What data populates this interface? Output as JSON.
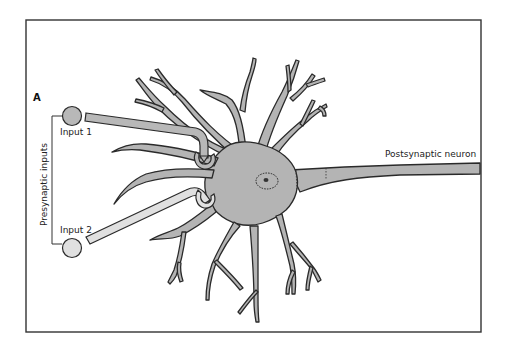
{
  "figure": {
    "panel_letter": "A",
    "labels": {
      "input_1": "Input 1",
      "input_2": "Input 2",
      "presynaptic_inputs": "Presynaptic inputs",
      "postsynaptic_neuron": "Postsynaptic neuron"
    },
    "colors": {
      "cell_fill": "#b4b4b4",
      "input1_fill": "#b8b8b8",
      "input2_fill": "#e0e0e0",
      "outline": "#2a2a2a",
      "frame": "#333333"
    }
  }
}
